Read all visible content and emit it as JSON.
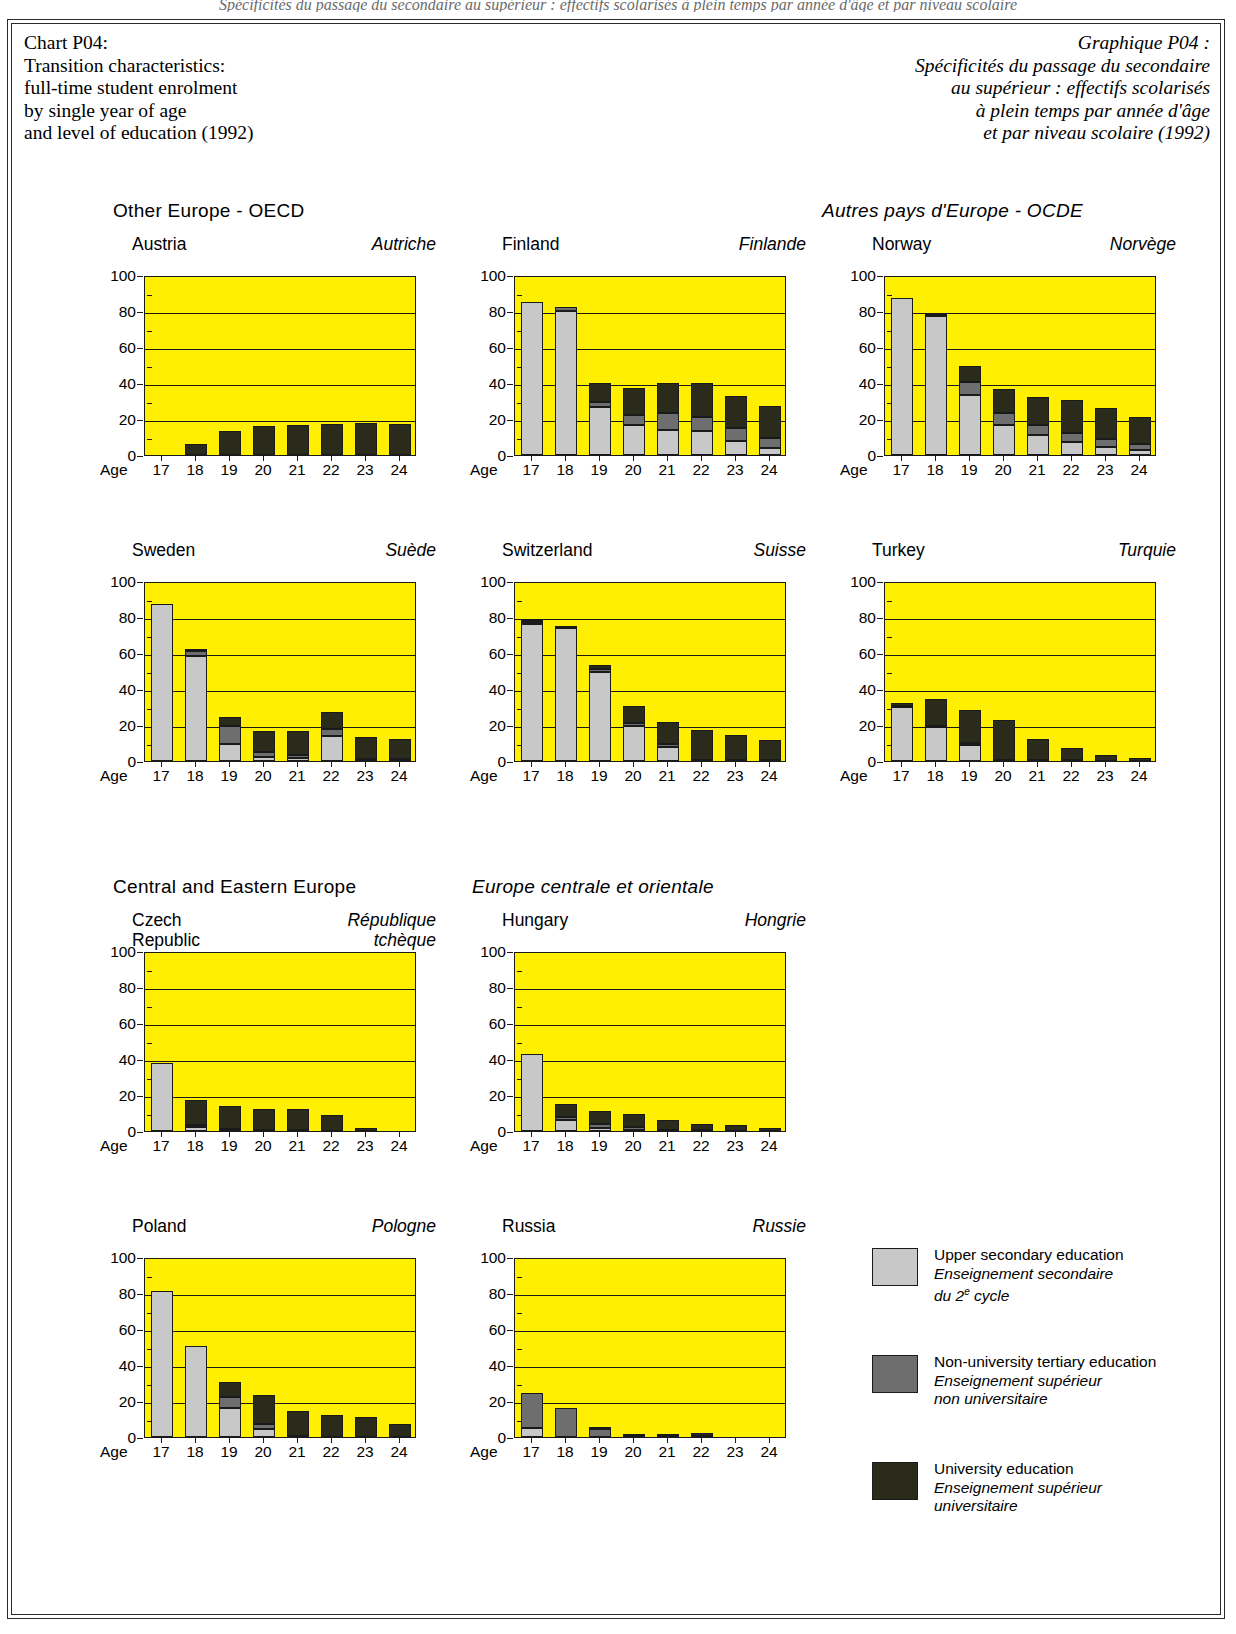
{
  "cut_off_text": "Spécificités du passage du secondaire au supérieur : effectifs scolarisés à plein temps par année d'âge et par niveau scolaire",
  "title": {
    "en": [
      "Chart P04:",
      "Transition characteristics:",
      "full-time student enrolment",
      "by single year of age",
      "and level of education (1992)"
    ],
    "fr": [
      "Graphique P04 :",
      "Spécificités du passage du secondaire",
      "au supérieur : effectifs scolarisés",
      "à plein temps par année d'âge",
      "et par niveau scolaire (1992)"
    ]
  },
  "bands": [
    {
      "en": "Other Europe - OECD",
      "fr": "Autres pays d'Europe - OCDE"
    },
    {
      "en": "Central and Eastern Europe",
      "fr": "Europe centrale et orientale"
    }
  ],
  "axis": {
    "x_caption": "Age",
    "ages": [
      "17",
      "18",
      "19",
      "20",
      "21",
      "22",
      "23",
      "24"
    ],
    "y_ticks": [
      "0",
      "20",
      "40",
      "60",
      "80",
      "100"
    ],
    "ylim": [
      0,
      100
    ]
  },
  "legend": [
    {
      "swatch": "#c8c8c8",
      "en": "Upper secondary education",
      "fr1": "Enseignement secondaire",
      "fr2": "du 2e cycle"
    },
    {
      "swatch": "#6e6e6e",
      "en": "Non-university tertiary education",
      "fr1": "Enseignement supérieur",
      "fr2": "non universitaire"
    },
    {
      "swatch": "#2b2b1c",
      "en": "University education",
      "fr1": "Enseignement supérieur",
      "fr2": "universitaire"
    }
  ],
  "colors": {
    "plot_background": "#ffef00",
    "upper_secondary": "#c8c8c8",
    "non_university": "#6e6e6e",
    "university": "#2b2b1c",
    "frame": "#1a1a1a"
  },
  "chart_data": {
    "type": "bar",
    "title": "Transition characteristics: full-time student enrolment by single year of age and level of education (1992)",
    "xlabel": "Age",
    "ylabel": "",
    "ylim": [
      0,
      100
    ],
    "grid": true,
    "stacked": true,
    "categories": [
      "17",
      "18",
      "19",
      "20",
      "21",
      "22",
      "23",
      "24"
    ],
    "series_names": [
      "Upper secondary education",
      "Non-university tertiary education",
      "University education"
    ],
    "panels": [
      {
        "name_en": "Austria",
        "name_fr": "Autriche",
        "band": 0,
        "series": [
          {
            "name": "Upper secondary education",
            "values": [
              0,
              0,
              0,
              0,
              0,
              0,
              0,
              0
            ]
          },
          {
            "name": "Non-university tertiary education",
            "values": [
              0,
              0,
              0,
              0,
              0,
              0,
              0,
              0
            ]
          },
          {
            "name": "University education",
            "values": [
              0,
              6,
              13.5,
              16,
              16.5,
              17,
              18,
              17
            ]
          }
        ]
      },
      {
        "name_en": "Finland",
        "name_fr": "Finlande",
        "band": 0,
        "series": [
          {
            "name": "Upper secondary education",
            "values": [
              85,
              80,
              26.5,
              16.5,
              14,
              13.5,
              8,
              4
            ]
          },
          {
            "name": "Non-university tertiary education",
            "values": [
              0,
              2,
              3,
              6,
              9.5,
              7.5,
              7,
              5.5
            ]
          },
          {
            "name": "University education",
            "values": [
              0,
              0,
              10.5,
              14.5,
              16.5,
              19,
              18,
              18
            ]
          }
        ]
      },
      {
        "name_en": "Norway",
        "name_fr": "Norvège",
        "band": 0,
        "series": [
          {
            "name": "Upper secondary education",
            "values": [
              87,
              77,
              33.5,
              16.5,
              11,
              7.5,
              4.5,
              3
            ]
          },
          {
            "name": "Non-university tertiary education",
            "values": [
              0,
              1.5,
              7,
              7,
              5.5,
              5,
              4.5,
              3
            ]
          },
          {
            "name": "University education",
            "values": [
              0,
              0,
              9,
              13,
              16,
              18,
              17,
              15
            ]
          }
        ]
      },
      {
        "name_en": "Sweden",
        "name_fr": "Suède",
        "band": 0,
        "series": [
          {
            "name": "Upper secondary education",
            "values": [
              87,
              58.5,
              9.5,
              2,
              1.5,
              14,
              0.5,
              0.5
            ]
          },
          {
            "name": "Non-university tertiary education",
            "values": [
              0,
              2.5,
              10,
              3,
              2,
              4,
              0.5,
              0.5
            ]
          },
          {
            "name": "University education",
            "values": [
              0,
              0.5,
              5,
              11.5,
              13,
              9,
              12.5,
              11.5
            ]
          }
        ]
      },
      {
        "name_en": "Switzerland",
        "name_fr": "Suisse",
        "band": 0,
        "series": [
          {
            "name": "Upper secondary education",
            "values": [
              76,
              74,
              49.5,
              19.5,
              8,
              0,
              0,
              0
            ]
          },
          {
            "name": "Non-university tertiary education",
            "values": [
              1.5,
              1,
              1.5,
              1.5,
              1.5,
              0.5,
              0.5,
              0.5
            ]
          },
          {
            "name": "University education",
            "values": [
              0.5,
              0,
              2.5,
              9.5,
              12,
              17,
              14,
              11
            ]
          }
        ]
      },
      {
        "name_en": "Turkey",
        "name_fr": "Turquie",
        "band": 0,
        "series": [
          {
            "name": "Upper secondary education",
            "values": [
              30,
              19,
              9,
              0,
              0,
              0,
              0,
              0
            ]
          },
          {
            "name": "Non-university tertiary education",
            "values": [
              0.5,
              0.5,
              1,
              0.5,
              0.5,
              0.5,
              0,
              0
            ]
          },
          {
            "name": "University education",
            "values": [
              1.5,
              15,
              18.5,
              22.5,
              11.5,
              7,
              3.5,
              1.5
            ]
          }
        ]
      },
      {
        "name_en_lines": [
          "Czech",
          "Republic"
        ],
        "name_fr_lines": [
          "République",
          "tchèque"
        ],
        "name_en": "Czech Republic",
        "name_fr": "République tchèque",
        "band": 1,
        "series": [
          {
            "name": "Upper secondary education",
            "values": [
              38,
              2,
              0.5,
              0,
              0,
              0,
              0,
              0
            ]
          },
          {
            "name": "Non-university tertiary education",
            "values": [
              0,
              1.5,
              0.5,
              0.5,
              0.5,
              0,
              0,
              0
            ]
          },
          {
            "name": "University education",
            "values": [
              0,
              13.5,
              13,
              11.5,
              12,
              9,
              1.5,
              0
            ]
          }
        ]
      },
      {
        "name_en": "Hungary",
        "name_fr": "Hongrie",
        "band": 1,
        "series": [
          {
            "name": "Upper secondary education",
            "values": [
              43,
              6,
              1.5,
              0.5,
              0,
              0,
              0,
              0
            ]
          },
          {
            "name": "Non-university tertiary education",
            "values": [
              0,
              2,
              2.5,
              1.5,
              0.5,
              0.5,
              0,
              0
            ]
          },
          {
            "name": "University education",
            "values": [
              0,
              7,
              7,
              7.5,
              5.5,
              3.5,
              3.5,
              1.5
            ]
          }
        ]
      },
      {
        "name_en": "Poland",
        "name_fr": "Pologne",
        "band": 1,
        "series": [
          {
            "name": "Upper secondary education",
            "values": [
              81,
              50.5,
              16,
              4.5,
              0,
              0,
              0,
              0
            ]
          },
          {
            "name": "Non-university tertiary education",
            "values": [
              0,
              0,
              6,
              2.5,
              0.5,
              0,
              0,
              0
            ]
          },
          {
            "name": "University education",
            "values": [
              0,
              0,
              8.5,
              16.5,
              14,
              12.5,
              11,
              7.5
            ]
          }
        ]
      },
      {
        "name_en": "Russia",
        "name_fr": "Russie",
        "band": 1,
        "series": [
          {
            "name": "Upper secondary education",
            "values": [
              5,
              0,
              0,
              0,
              0,
              0,
              0,
              0
            ]
          },
          {
            "name": "Non-university tertiary education",
            "values": [
              19.5,
              16,
              4.5,
              0.5,
              0.5,
              0.5,
              0,
              0
            ]
          },
          {
            "name": "University education",
            "values": [
              0,
              0,
              0.5,
              1,
              1,
              1.5,
              0,
              0
            ]
          }
        ]
      }
    ]
  }
}
